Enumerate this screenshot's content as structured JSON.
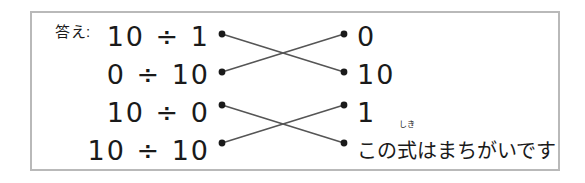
{
  "frame": {
    "border_color": "#b9b9b9",
    "background": "#ffffff"
  },
  "label": {
    "answer": "答え:"
  },
  "rows": [
    {
      "equation": "10 ÷ 1",
      "answer": "0"
    },
    {
      "equation": "0 ÷ 10",
      "answer": "10"
    },
    {
      "equation": "10 ÷ 0",
      "answer": "1"
    },
    {
      "equation": "10 ÷ 10",
      "answer_prefix": "この",
      "answer_ruby_base": "式",
      "answer_ruby_text": "しき",
      "answer_suffix": "はまちがいです"
    }
  ],
  "connections": {
    "line_color": "#555555",
    "dot_color": "#1a1a1a",
    "pairs": [
      {
        "from_row": 1,
        "to_row": 2
      },
      {
        "from_row": 2,
        "to_row": 1
      },
      {
        "from_row": 3,
        "to_row": 4
      },
      {
        "from_row": 4,
        "to_row": 3
      }
    ]
  }
}
